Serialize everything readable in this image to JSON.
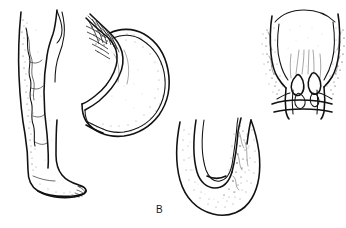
{
  "figure": {
    "panel_label": "B",
    "panel_label_position": {
      "x": 156,
      "y": 205
    },
    "background_color": "#ffffff",
    "ink_color": "#111111",
    "canvas": {
      "width": 346,
      "height": 228
    },
    "medium": "black-and-white line drawing with stipple shading"
  },
  "illustrations": [
    {
      "id": "leg-varicose-veins",
      "name": "Lower leg and foot with varicose veins",
      "position": {
        "x": 10,
        "y": 8,
        "width": 80,
        "height": 190
      },
      "features": [
        "anterior lower limb from knee to foot",
        "tortuous dilated superficial vein running down the medial shin",
        "stippled shading along the tibial border",
        "foot in profile with outlined toes"
      ]
    },
    {
      "id": "stomach-esophageal-varices",
      "name": "Stomach and lower esophagus with esophageal varices",
      "position": {
        "x": 80,
        "y": 14,
        "width": 100,
        "height": 125
      },
      "features": [
        "lower esophagus descending from upper left",
        "crosshatched dilated submucosal veins (esophageal varices) at the gastroesophageal junction",
        "gastric fundus and body outlined with double contour",
        "greater curvature stippled",
        "lesser curvature and antrum tapering to lower left"
      ]
    },
    {
      "id": "u-shaped-vessel-segment",
      "name": "U-shaped vessel / bowel segment in longitudinal section",
      "position": {
        "x": 172,
        "y": 118,
        "width": 95,
        "height": 100
      },
      "features": [
        "hairpin U-shaped loop opening upward",
        "inner lumen drawn as a narrow parallel channel",
        "thick stippled wall around the bend",
        "dense irregular stippling on the right-hand wall"
      ]
    },
    {
      "id": "rectum-anal-canal-hemorrhoids",
      "name": "Rectum and anal canal in coronal section with hemorrhoids",
      "position": {
        "x": 258,
        "y": 10,
        "width": 86,
        "height": 108
      },
      "features": [
        "ampulla of the rectum widening superiorly",
        "columns of dilated veins stippled along both lateral walls",
        "internal hemorrhoidal plexus bulging into the lumen at the dentate line",
        "anal canal narrowing inferiorly",
        "external sphincter outlined at the base"
      ]
    }
  ]
}
